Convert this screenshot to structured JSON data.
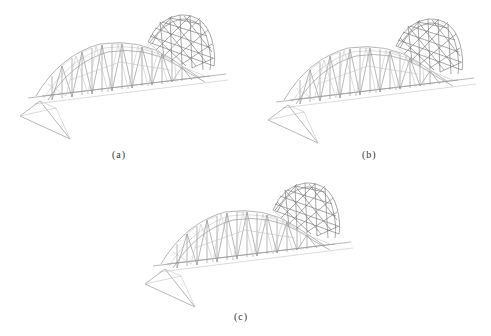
{
  "figure": {
    "panels": [
      {
        "id": "a",
        "caption": "(a)",
        "subject": "arch truss bridge model with dome"
      },
      {
        "id": "b",
        "caption": "(b)",
        "subject": "arch truss bridge model with dome"
      },
      {
        "id": "c",
        "caption": "(c)",
        "subject": "arch truss bridge model with dome"
      }
    ]
  },
  "colors": {
    "background": "#ffffff",
    "member": "#9a9a9a",
    "dense_member": "#6e6e6e",
    "light_member": "#c4c4c4",
    "caption": "#333333"
  }
}
